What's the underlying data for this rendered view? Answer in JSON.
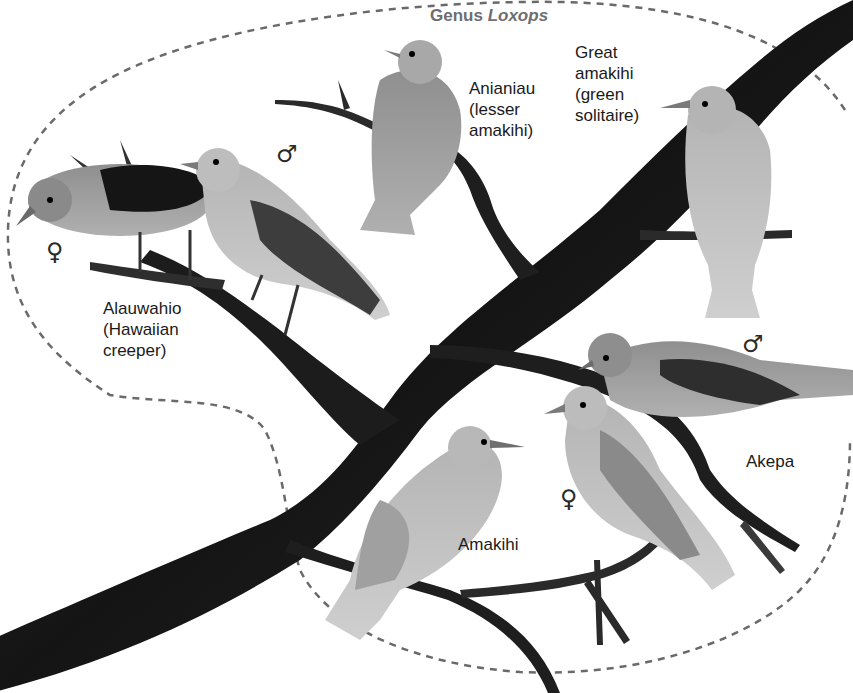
{
  "figure": {
    "genus_prefix": "Genus",
    "genus_name": "Loxops",
    "colors": {
      "branch": "#1e1e1e",
      "outline": "#6a6a6a",
      "bird_light": "#c8c8c8",
      "bird_mid": "#9a9a9a",
      "bird_dark": "#3a3a3a",
      "text": "#1a1a1a",
      "genus_text": "#6e6e6e"
    },
    "species": [
      {
        "name": "Alauwahio",
        "lines": [
          "Alauwahio",
          "(Hawaiian",
          "creeper)"
        ],
        "sexes_shown": [
          "female",
          "male"
        ]
      },
      {
        "name": "Anianiau",
        "lines": [
          "Anianiau",
          "(lesser",
          "amakihi)"
        ]
      },
      {
        "name": "Great amakihi",
        "lines": [
          "Great",
          "amakihi",
          "(green",
          "solitaire)"
        ]
      },
      {
        "name": "Akepa",
        "lines": [
          "Akepa"
        ],
        "sexes_shown": [
          "male",
          "female"
        ]
      },
      {
        "name": "Amakihi",
        "lines": [
          "Amakihi"
        ]
      }
    ],
    "sex_symbols": {
      "male": "♂",
      "female": "♀"
    }
  }
}
